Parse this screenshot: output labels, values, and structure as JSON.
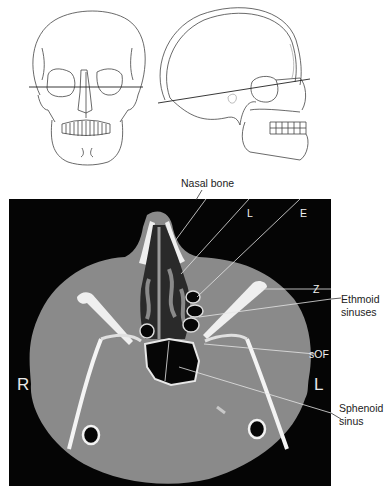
{
  "figure": {
    "top_panel": {
      "left_drawing": "skull-frontal-view",
      "right_drawing": "skull-lateral-view",
      "description": "Scan plane line through orbits"
    },
    "ct_image": {
      "orientation_left": "R",
      "orientation_right": "L",
      "background_color": "#050505",
      "tissue_color": "#8a8a8a",
      "bone_color": "#f2f2f2"
    },
    "labels": {
      "nasal_bone": "Nasal bone",
      "l": "L",
      "e": "E",
      "z": "Z",
      "ethmoid_line1": "Ethmoid",
      "ethmoid_line2": "sinuses",
      "sof": "sOF",
      "sphenoid_line1": "Sphenoid",
      "sphenoid_line2": "sinus"
    }
  }
}
